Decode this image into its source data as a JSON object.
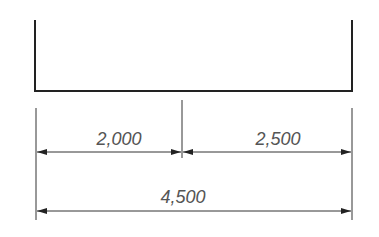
{
  "diagram": {
    "type": "dimension-drawing",
    "dimensions": {
      "left_segment": "2,000",
      "right_segment": "2,500",
      "total": "4,500"
    },
    "colors": {
      "line": "#222222",
      "text": "#555555"
    }
  }
}
